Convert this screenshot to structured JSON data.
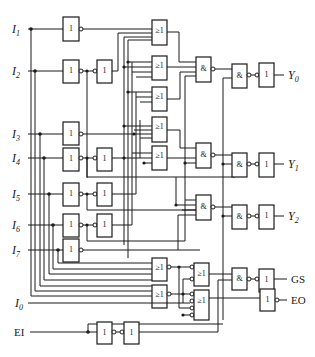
{
  "diagram": {
    "type": "logic-circuit",
    "inputs": [
      {
        "id": "I1",
        "name": "I",
        "sub": "1"
      },
      {
        "id": "I2",
        "name": "I",
        "sub": "2"
      },
      {
        "id": "I3",
        "name": "I",
        "sub": "3"
      },
      {
        "id": "I4",
        "name": "I",
        "sub": "4"
      },
      {
        "id": "I5",
        "name": "I",
        "sub": "5"
      },
      {
        "id": "I6",
        "name": "I",
        "sub": "6"
      },
      {
        "id": "I7",
        "name": "I",
        "sub": "7"
      },
      {
        "id": "I0",
        "name": "I",
        "sub": "0"
      },
      {
        "id": "EI",
        "name": "EI",
        "sub": ""
      }
    ],
    "outputs": [
      {
        "id": "Y0",
        "name": "Y",
        "sub": "0"
      },
      {
        "id": "Y1",
        "name": "Y",
        "sub": "1"
      },
      {
        "id": "Y2",
        "name": "Y",
        "sub": "2"
      },
      {
        "id": "GS",
        "name": "GS",
        "sub": ""
      },
      {
        "id": "EO",
        "name": "EO",
        "sub": ""
      }
    ],
    "gate_symbols": {
      "not": "1",
      "or": "≥1",
      "and": "&"
    }
  }
}
